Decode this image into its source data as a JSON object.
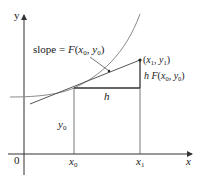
{
  "diagram": {
    "type": "euler-method-step",
    "axes": {
      "x_label": "x",
      "y_label": "y",
      "origin_label": "0",
      "color": "#333333"
    },
    "ticks": {
      "x0_label": "x",
      "x0_sub": "0",
      "x1_label": "x",
      "x1_sub": "1"
    },
    "labels": {
      "slope_prefix": "slope = ",
      "slope_func": "F",
      "slope_args_open": "(",
      "slope_x": "x",
      "slope_x_sub": "0",
      "slope_comma": ", ",
      "slope_y": "y",
      "slope_y_sub": "0",
      "slope_args_close": ")",
      "point1_open": "(",
      "point1_x": "x",
      "point1_x_sub": "1",
      "point1_comma": ", ",
      "point1_y": "y",
      "point1_y_sub": "1",
      "point1_close": ")",
      "rise_h": "h",
      "rise_func": " F",
      "rise_open": "(",
      "rise_x": "x",
      "rise_x_sub": "0",
      "rise_comma": ", ",
      "rise_y": "y",
      "rise_y_sub": "0",
      "rise_close": ")",
      "run_h": "h",
      "y0_label": "y",
      "y0_sub": "0"
    },
    "colors": {
      "curve": "#8a8a8a",
      "tangent": "#555555",
      "triangle": "#333333",
      "text": "#1a1a1a"
    }
  }
}
